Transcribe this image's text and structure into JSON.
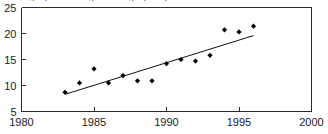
{
  "figure": {
    "width": 328,
    "height": 134,
    "background": "#ffffff",
    "top_cropped_caption": "Average percentage change per year"
  },
  "chart_data": {
    "type": "scatter",
    "title": "",
    "subtitle": "",
    "xlabel": "",
    "ylabel": "",
    "xlim": [
      1980,
      2000
    ],
    "ylim": [
      5,
      25
    ],
    "xticks": [
      1980,
      1985,
      1990,
      1995,
      2000
    ],
    "yticks": [
      5,
      10,
      15,
      20,
      25
    ],
    "xtick_labels": [
      "1980",
      "1985",
      "1990",
      "1995",
      "2000"
    ],
    "ytick_labels": [
      "5",
      "10",
      "15",
      "20",
      "25"
    ],
    "grid": false,
    "legend": false,
    "legend_position": "none",
    "marker": "diamond",
    "marker_color": "#000000",
    "series": [
      {
        "name": "observations",
        "type": "scatter",
        "x": [
          1983,
          1984,
          1985,
          1986,
          1987,
          1988,
          1989,
          1990,
          1991,
          1992,
          1993,
          1994,
          1995,
          1996
        ],
        "y": [
          8.7,
          10.5,
          13.2,
          10.5,
          11.9,
          10.9,
          10.9,
          14.2,
          15.0,
          14.7,
          15.8,
          20.7,
          20.3,
          21.4
        ]
      },
      {
        "name": "trend-line",
        "type": "line",
        "x": [
          1983,
          1996
        ],
        "y": [
          8.3,
          19.6
        ]
      }
    ]
  }
}
